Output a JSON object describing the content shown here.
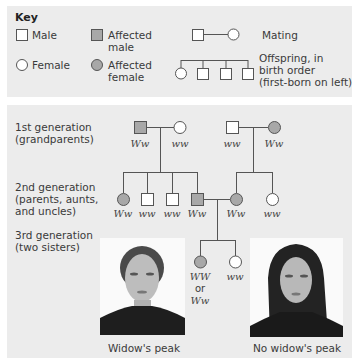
{
  "key": {
    "title": "Key",
    "male": "Male",
    "female": "Female",
    "affected_male_1": "Affected",
    "affected_male_2": "male",
    "affected_female_1": "Affected",
    "affected_female_2": "female",
    "mating": "Mating",
    "offspring_1": "Offspring, in",
    "offspring_2": "birth order",
    "offspring_3": "(first-born on left)"
  },
  "generations": {
    "g1_line1": "1st generation",
    "g1_line2": "(grandparents)",
    "g2_line1": "2nd generation",
    "g2_line2": "(parents, aunts,",
    "g2_line3": "and uncles)",
    "g3_line1": "3rd generation",
    "g3_line2": "(two sisters)"
  },
  "genotypes": {
    "g1": [
      "Ww",
      "ww",
      "ww",
      "Ww"
    ],
    "g2": [
      "Ww",
      "ww",
      "ww",
      "Ww",
      "Ww",
      "ww"
    ],
    "g3_left_1": "WW",
    "g3_left_or": "or",
    "g3_left_2": "Ww",
    "g3_right": "ww"
  },
  "captions": {
    "left": "Widow's peak",
    "right": "No widow's peak"
  },
  "colors": {
    "affected": "#a8a8a8",
    "unaffected": "#ffffff",
    "line": "#555555",
    "panel": "#ececec"
  }
}
